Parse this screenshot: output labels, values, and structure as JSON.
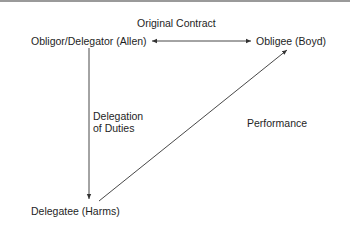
{
  "diagram": {
    "title": "Original Contract",
    "nodes": {
      "obligor": "Obligor/Delegator (Allen)",
      "obligee": "Obligee (Boyd)",
      "delegatee": "Delegatee (Harms)"
    },
    "edges": {
      "delegation_line1": "Delegation",
      "delegation_line2": "of Duties",
      "performance": "Performance"
    },
    "colors": {
      "line": "#333333",
      "top_border": "#9a9a9a"
    }
  }
}
